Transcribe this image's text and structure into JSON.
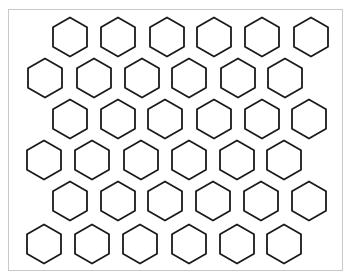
{
  "figure": {
    "shape": "hexagon",
    "orientation": "pointy-top",
    "stroke_color": "#1a1a1a",
    "fill_color": "#ffffff",
    "frame_color": "#c8c8c8",
    "hex_width": 34,
    "hex_height": 39,
    "rows": [
      {
        "y": 37,
        "x": [
          70,
          118,
          167,
          214,
          262,
          311
        ]
      },
      {
        "y": 78,
        "x": [
          45,
          94,
          142,
          189,
          238,
          285
        ]
      },
      {
        "y": 119,
        "x": [
          70,
          118,
          165,
          214,
          262,
          309
        ]
      },
      {
        "y": 160,
        "x": [
          44,
          92,
          141,
          189,
          237,
          284
        ]
      },
      {
        "y": 201,
        "x": [
          70,
          118,
          165,
          213,
          261,
          309
        ]
      },
      {
        "y": 244,
        "x": [
          44,
          92,
          140,
          189,
          237,
          284
        ]
      }
    ],
    "total_count": 36
  }
}
